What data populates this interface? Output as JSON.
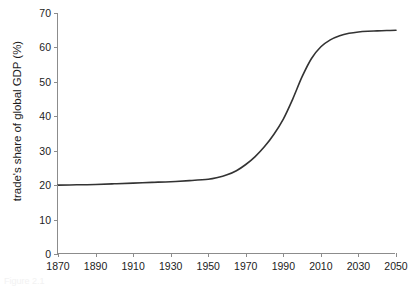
{
  "figure": {
    "caption": "Figure 2.1"
  },
  "chart_data": {
    "type": "line",
    "title": "",
    "subtitle": "",
    "xlabel": "",
    "ylabel": "trade's share of global GDP (%)",
    "xlim": [
      1870,
      2050
    ],
    "ylim": [
      0,
      70
    ],
    "grid": false,
    "legend": null,
    "legend_position": "none",
    "x_ticks": [
      1870,
      1890,
      1910,
      1930,
      1950,
      1970,
      1990,
      2010,
      2030,
      2050
    ],
    "x_tick_labels": [
      "1870",
      "1890",
      "1910",
      "1930",
      "1950",
      "1970",
      "1990",
      "2010",
      "2030",
      "2050"
    ],
    "y_ticks": [
      0,
      10,
      20,
      30,
      40,
      50,
      60,
      70
    ],
    "y_tick_labels": [
      "0",
      "10",
      "20",
      "30",
      "40",
      "50",
      "60",
      "70"
    ],
    "series": [
      {
        "name": "trade's share of global GDP",
        "color": "#333333",
        "line_width": 1.6,
        "x": [
          1870,
          1880,
          1890,
          1900,
          1910,
          1920,
          1930,
          1940,
          1950,
          1955,
          1960,
          1965,
          1970,
          1975,
          1980,
          1985,
          1990,
          1995,
          2000,
          2005,
          2010,
          2015,
          2020,
          2025,
          2030,
          2035,
          2040,
          2045,
          2050
        ],
        "values": [
          20.0,
          20.1,
          20.2,
          20.4,
          20.6,
          20.8,
          21.0,
          21.3,
          21.7,
          22.2,
          23.0,
          24.2,
          26.0,
          28.3,
          31.2,
          34.8,
          39.2,
          45.0,
          51.5,
          56.8,
          60.2,
          62.2,
          63.4,
          64.1,
          64.5,
          64.7,
          64.8,
          64.9,
          65.0
        ]
      }
    ],
    "annotations": []
  },
  "axes": {
    "axis_color": "#8c8c8c",
    "tick_color": "#8c8c8c",
    "label_color": "#1c1c1c",
    "background": "#ffffff"
  }
}
